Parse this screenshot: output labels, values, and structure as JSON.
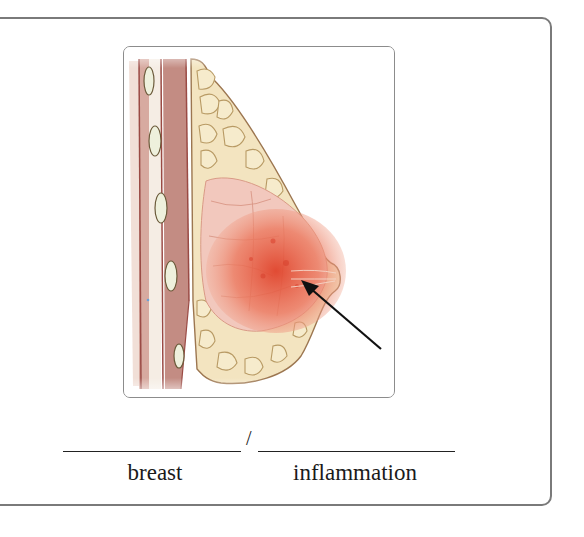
{
  "figure": {
    "arrow_target": "inflamed-tissue-near-nipple",
    "colors": {
      "frame_border": "#8c8c8c",
      "outer_border": "#7a7a7a",
      "fat_lobule": "#f3e4c0",
      "fat_outline": "#b89a64",
      "muscle": "#c9938a",
      "inflammation": "#e4654a",
      "arrow": "#111111"
    }
  },
  "exercise": {
    "separator": "/",
    "parts": [
      {
        "label": "breast",
        "answer": ""
      },
      {
        "label": "inflammation",
        "answer": ""
      }
    ]
  }
}
